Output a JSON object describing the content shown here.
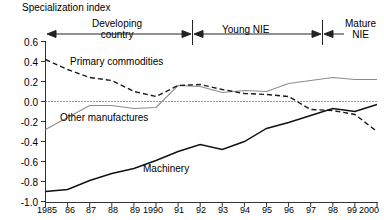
{
  "chart_data": {
    "type": "line",
    "title": "",
    "ylabel": "Specialization index",
    "xlabel": "",
    "ylim": [
      -1.0,
      0.6
    ],
    "yticks": [
      "0.6",
      "0.4",
      "0.2",
      "0.0",
      "-0.2",
      "-0.4",
      "-0.6",
      "-0.8",
      "-1.0"
    ],
    "ytick_values": [
      0.6,
      0.4,
      0.2,
      0.0,
      -0.2,
      -0.4,
      -0.6,
      -0.8,
      -1.0
    ],
    "grid": false,
    "zero_line": true,
    "legend_position": "inline-annotations",
    "categories": [
      "1985",
      "86",
      "87",
      "88",
      "89",
      "1990",
      "91",
      "92",
      "93",
      "94",
      "95",
      "96",
      "97",
      "98",
      "99",
      "2000"
    ],
    "x": [
      1985,
      1986,
      1987,
      1988,
      1989,
      1990,
      1991,
      1992,
      1993,
      1994,
      1995,
      1996,
      1997,
      1998,
      1999,
      2000
    ],
    "series": [
      {
        "name": "Primary commodities",
        "style": "dashed",
        "color": "#1a1a1a",
        "values": [
          0.42,
          0.32,
          0.24,
          0.21,
          0.1,
          0.05,
          0.16,
          0.17,
          0.12,
          0.08,
          0.07,
          0.05,
          -0.08,
          -0.09,
          -0.13,
          -0.3
        ]
      },
      {
        "name": "Other manufactures",
        "style": "solid",
        "color": "#8c8c8c",
        "values": [
          -0.28,
          -0.16,
          -0.04,
          -0.04,
          -0.07,
          -0.06,
          0.16,
          0.15,
          0.09,
          0.11,
          0.1,
          0.18,
          0.21,
          0.24,
          0.22,
          0.22
        ]
      },
      {
        "name": "Machinery",
        "style": "solid",
        "color": "#111111",
        "values": [
          -0.9,
          -0.88,
          -0.79,
          -0.72,
          -0.67,
          -0.59,
          -0.5,
          -0.43,
          -0.48,
          -0.4,
          -0.27,
          -0.21,
          -0.14,
          -0.07,
          -0.1,
          -0.03
        ]
      }
    ],
    "annotations": [
      {
        "text": "Developing country",
        "type": "span-arrow",
        "from": "1985",
        "to": "1991"
      },
      {
        "text": "Young NIE",
        "type": "span-arrow",
        "from": "1991",
        "to": "1998"
      },
      {
        "text": "Mature NIE",
        "type": "span-arrow",
        "from": "1998",
        "to": "2000"
      }
    ]
  },
  "labels": {
    "axis_title": "Specialization index",
    "region_developing_line1": "Developing",
    "region_developing_line2": "country",
    "region_young": "Young NIE",
    "region_mature_line1": "Mature",
    "region_mature_line2": "NIE",
    "series_primary": "Primary commodities",
    "series_other": "Other manufactures",
    "series_machinery": "Machinery"
  },
  "yticks": {
    "t0": "0.6",
    "t1": "0.4",
    "t2": "0.2",
    "t3": "0.0",
    "t4": "-0.2",
    "t5": "-0.4",
    "t6": "-0.6",
    "t7": "-0.8",
    "t8": "-1.0"
  },
  "xticks": {
    "t0": "1985",
    "t1": "86",
    "t2": "87",
    "t3": "88",
    "t4": "89",
    "t5": "1990",
    "t6": "91",
    "t7": "92",
    "t8": "93",
    "t9": "94",
    "t10": "95",
    "t11": "96",
    "t12": "97",
    "t13": "98",
    "t14": "99",
    "t15": "2000"
  },
  "colors": {
    "primary_series": "#1a1a1a",
    "other_series": "#8c8c8c",
    "machinery_series": "#111111",
    "axis": "#333333",
    "background": "#ffffff"
  }
}
